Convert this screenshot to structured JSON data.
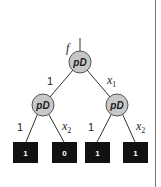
{
  "diagram": {
    "input_label": "f",
    "root": {
      "label": "pD"
    },
    "left_child": {
      "label": "pD"
    },
    "right_child": {
      "label": "pD"
    },
    "edge_labels": {
      "root_left": "1",
      "root_right_var": "x",
      "root_right_sub": "1",
      "left_left": "1",
      "left_right_var": "x",
      "left_right_sub": "2",
      "right_left": "1",
      "right_right_var": "x",
      "right_right_sub": "2"
    },
    "leaves": [
      "1",
      "0",
      "1",
      "1"
    ]
  },
  "colors": {
    "node_fill": "#c8c8c8",
    "leaf_fill": "#111111",
    "leaf_text": "#ffffff",
    "border": "#555555"
  }
}
